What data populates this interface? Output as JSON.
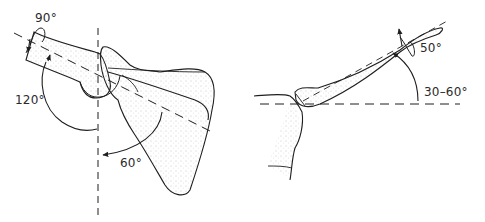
{
  "figure": {
    "panels": [
      {
        "id": "scapula-humerus-view",
        "description": "Anterior view of humerus and scapula with rotation and abduction arcs",
        "labels": [
          {
            "text": "90°",
            "meaning": "rotation"
          },
          {
            "text": "120°",
            "meaning": "glenohumeral arc"
          },
          {
            "text": "60°",
            "meaning": "scapular rotation"
          }
        ]
      },
      {
        "id": "clavicle-elevation-view",
        "description": "Clavicle elevation from sternoclavicular joint",
        "labels": [
          {
            "text": "50°",
            "meaning": "clavicular rotation"
          },
          {
            "text": "30–60°",
            "meaning": "clavicular elevation"
          }
        ]
      }
    ],
    "colors": {
      "line": "#1f1f1f",
      "stipple": "#9a9a9a",
      "background": "#ffffff"
    }
  },
  "labels": {
    "angle_90": "90°",
    "angle_120": "120°",
    "angle_60": "60°",
    "angle_50": "50°",
    "angle_30_60": "30–60°"
  }
}
